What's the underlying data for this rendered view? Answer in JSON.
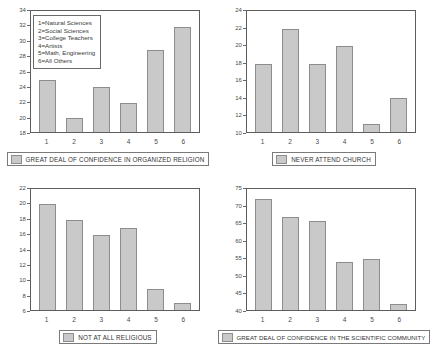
{
  "figure": {
    "panel_count": 4,
    "bar_fill_color": "#c9c9c9",
    "bar_border_color": "#8d8d8d",
    "axis_color": "#5d5d5d",
    "corner_artifact": ""
  },
  "group_legend": {
    "lines": [
      "1=Natural Sciences",
      "2=Social Sciences",
      "3=College Teachers",
      "4=Artists",
      "5=Math, Engineering",
      "6=All Others"
    ]
  },
  "chart_data": [
    {
      "type": "bar",
      "title": "GREAT DEAL OF CONFIDENCE IN ORGANIZED RELIGION",
      "categories": [
        "1",
        "2",
        "3",
        "4",
        "5",
        "6"
      ],
      "values": [
        24.9,
        19.9,
        23.9,
        21.9,
        28.8,
        31.9
      ],
      "xlabel": "",
      "ylabel": "",
      "ylim": [
        18,
        34
      ],
      "yticks": [
        18,
        20,
        22,
        24,
        26,
        28,
        30,
        32,
        34
      ],
      "grid": false,
      "legend_position": "inside-top-left"
    },
    {
      "type": "bar",
      "title": "NEVER ATTEND CHURCH",
      "categories": [
        "1",
        "2",
        "3",
        "4",
        "5",
        "6"
      ],
      "values": [
        17.9,
        21.9,
        17.9,
        19.9,
        10.9,
        13.9
      ],
      "xlabel": "",
      "ylabel": "",
      "ylim": [
        10,
        24
      ],
      "yticks": [
        10,
        12,
        14,
        16,
        18,
        20,
        22,
        24
      ],
      "grid": false,
      "legend_position": "below"
    },
    {
      "type": "bar",
      "title": "NOT AT ALL RELIGIOUS",
      "categories": [
        "1",
        "2",
        "3",
        "4",
        "5",
        "6"
      ],
      "values": [
        20.0,
        17.9,
        15.9,
        16.9,
        8.8,
        6.9
      ],
      "xlabel": "",
      "ylabel": "",
      "ylim": [
        6,
        22
      ],
      "yticks": [
        6,
        8,
        10,
        12,
        14,
        16,
        18,
        20,
        22
      ],
      "grid": false,
      "legend_position": "below"
    },
    {
      "type": "bar",
      "title": "GREAT DEAL OF CONFIDENCE IN THE SCIENTIFIC COMMUNITY",
      "categories": [
        "1",
        "2",
        "3",
        "4",
        "5",
        "6"
      ],
      "values": [
        72.0,
        66.8,
        65.7,
        53.8,
        54.8,
        41.7
      ],
      "xlabel": "",
      "ylabel": "",
      "ylim": [
        40,
        75
      ],
      "yticks": [
        40,
        45,
        50,
        55,
        60,
        65,
        70,
        75
      ],
      "grid": false,
      "legend_position": "below"
    }
  ]
}
